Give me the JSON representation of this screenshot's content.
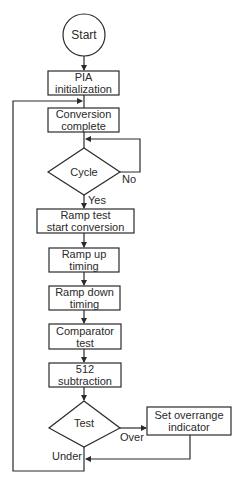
{
  "diagram": {
    "type": "flowchart",
    "nodes": {
      "start": {
        "label": "Start",
        "shape": "circle"
      },
      "pia_init": {
        "label_1": "PIA",
        "label_2": "initialization",
        "shape": "process"
      },
      "conversion_complete": {
        "label_1": "Conversion",
        "label_2": "complete",
        "shape": "process"
      },
      "cycle": {
        "label": "Cycle",
        "shape": "decision"
      },
      "ramp_test": {
        "label_1": "Ramp test",
        "label_2": "start conversion",
        "shape": "process"
      },
      "ramp_up": {
        "label_1": "Ramp up",
        "label_2": "timing",
        "shape": "process"
      },
      "ramp_down": {
        "label_1": "Ramp down",
        "label_2": "timing",
        "shape": "process"
      },
      "comparator": {
        "label_1": "Comparator",
        "label_2": "test",
        "shape": "process"
      },
      "subtraction": {
        "label_1": "512",
        "label_2": "subtraction",
        "shape": "process"
      },
      "test": {
        "label": "Test",
        "shape": "decision"
      },
      "overrange": {
        "label_1": "Set overrange",
        "label_2": "indicator",
        "shape": "process"
      }
    },
    "edge_labels": {
      "cycle_no": "No",
      "cycle_yes": "Yes",
      "test_over": "Over",
      "test_under": "Under"
    },
    "edges": [
      [
        "start",
        "pia_init"
      ],
      [
        "pia_init",
        "conversion_complete"
      ],
      [
        "conversion_complete",
        "cycle"
      ],
      [
        "cycle",
        "cycle",
        "No"
      ],
      [
        "cycle",
        "ramp_test",
        "Yes"
      ],
      [
        "ramp_test",
        "ramp_up"
      ],
      [
        "ramp_up",
        "ramp_down"
      ],
      [
        "ramp_down",
        "comparator"
      ],
      [
        "comparator",
        "subtraction"
      ],
      [
        "subtraction",
        "test"
      ],
      [
        "test",
        "overrange",
        "Over"
      ],
      [
        "test",
        "conversion_complete",
        "Under"
      ],
      [
        "overrange",
        "conversion_complete"
      ]
    ],
    "colors": {
      "stroke": "#2a2a2a",
      "background": "#ffffff"
    }
  }
}
